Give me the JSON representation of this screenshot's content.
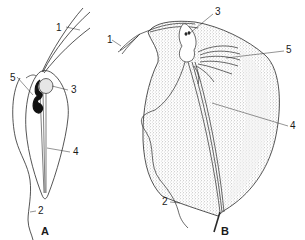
{
  "figure": {
    "panels": [
      {
        "id": "A",
        "label": "A",
        "parts": [
          {
            "number": "1",
            "label": "1"
          },
          {
            "number": "2",
            "label": "2"
          },
          {
            "number": "3",
            "label": "3"
          },
          {
            "number": "4",
            "label": "4"
          },
          {
            "number": "5",
            "label": "5"
          }
        ]
      },
      {
        "id": "B",
        "label": "B",
        "parts": [
          {
            "number": "1",
            "label": "1"
          },
          {
            "number": "2",
            "label": "2"
          },
          {
            "number": "3",
            "label": "3"
          },
          {
            "number": "4",
            "label": "4"
          },
          {
            "number": "5",
            "label": "5"
          }
        ]
      }
    ]
  },
  "colors": {
    "line": "#2a2a2a",
    "stipple": "#c8c8c8",
    "background": "#ffffff"
  }
}
